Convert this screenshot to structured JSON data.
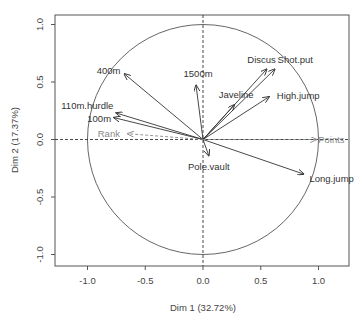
{
  "chart_data": {
    "type": "scatter",
    "subtype": "pca-variables-correlation-circle",
    "title": "",
    "xlabel": "Dim 1 (32.72%)",
    "ylabel": "Dim 2 (17.37%)",
    "xlim": [
      -1.25,
      1.25
    ],
    "ylim": [
      -1.08,
      1.08
    ],
    "xticks": [
      -1.0,
      -0.5,
      0.0,
      0.5,
      1.0
    ],
    "xtick_labels": [
      "-1.0",
      "-0.5",
      "0.0",
      "0.5",
      "1.0"
    ],
    "yticks": [
      -1.0,
      -0.5,
      0.0,
      0.5,
      1.0
    ],
    "ytick_labels": [
      "-1.0",
      "-0.5",
      "0.0",
      "0.5",
      "1.0"
    ],
    "grid": false,
    "unit_circle": true,
    "reference_lines": [
      "x=0 dashed",
      "y=0 dashed"
    ],
    "legend": null,
    "series": [
      {
        "name": "active variables",
        "style": "solid arrows",
        "color": "#333333",
        "points": [
          {
            "label": "100m",
            "x": -0.77,
            "y": 0.19
          },
          {
            "label": "Long.jump",
            "x": 0.87,
            "y": -0.3
          },
          {
            "label": "Shot.put",
            "x": 0.62,
            "y": 0.61
          },
          {
            "label": "High.jump",
            "x": 0.57,
            "y": 0.37
          },
          {
            "label": "400m",
            "x": -0.68,
            "y": 0.57
          },
          {
            "label": "110m.hurdle",
            "x": -0.75,
            "y": 0.23
          },
          {
            "label": "Discus",
            "x": 0.55,
            "y": 0.61
          },
          {
            "label": "Pole.vault",
            "x": 0.05,
            "y": -0.14
          },
          {
            "label": "Javeline",
            "x": 0.27,
            "y": 0.3
          },
          {
            "label": "1500m",
            "x": -0.06,
            "y": 0.47
          }
        ]
      },
      {
        "name": "supplementary variables",
        "style": "dashed arrows",
        "color": "#888888",
        "points": [
          {
            "label": "Rank",
            "x": -0.65,
            "y": 0.05
          },
          {
            "label": "Points",
            "x": 0.98,
            "y": 0.0
          }
        ]
      }
    ]
  },
  "plot": {
    "xlabel": "Dim 1 (32.72%)",
    "ylabel": "Dim 2 (17.37%)",
    "xtick_labels": [
      "-1.0",
      "-0.5",
      "0.0",
      "0.5",
      "1.0"
    ],
    "ytick_labels": [
      "-1.0",
      "-0.5",
      "0.0",
      "0.5",
      "1.0"
    ],
    "colors": {
      "active": "#333333",
      "supplementary": "#888888",
      "frame": "#555555",
      "circle": "#555555"
    }
  }
}
